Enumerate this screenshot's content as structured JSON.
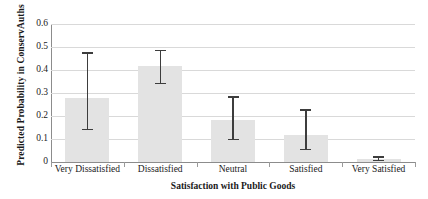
{
  "chart_data": {
    "type": "bar",
    "title": "",
    "xlabel": "Satisfaction with Public Goods",
    "ylabel": "Predicted Probability in ConservAuths",
    "categories": [
      "Very Dissatisfied",
      "Dissatisfied",
      "Neutral",
      "Satisfied",
      "Very Satisfied"
    ],
    "values": [
      0.28,
      0.418,
      0.181,
      0.118,
      0.012
    ],
    "error_low": [
      0.138,
      0.337,
      0.095,
      0.052,
      0.004
    ],
    "error_high": [
      0.477,
      0.489,
      0.285,
      0.229,
      0.025
    ],
    "ylim": [
      0,
      0.6
    ],
    "yticks": [
      0,
      0.1,
      0.2,
      0.3,
      0.4,
      0.5,
      0.6
    ],
    "ytick_labels": [
      "0",
      "0.1",
      "0.2",
      "0.3",
      "0.4",
      "0.5",
      "0.6"
    ],
    "grid": true,
    "legend": "none",
    "bar_color": "#e3e3e3",
    "error_color": "#3d3d3d",
    "gridline_color": "#d9d9d9",
    "axis_color": "#8c8c8c"
  }
}
